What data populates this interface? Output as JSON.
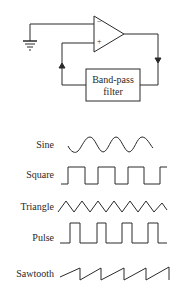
{
  "circuit": {
    "filter_label_line1": "Band-pass",
    "filter_label_line2": "filter",
    "inverting_sign": "−",
    "noninverting_sign": "+"
  },
  "waveforms": [
    {
      "label": "Sine"
    },
    {
      "label": "Square"
    },
    {
      "label": "Triangle"
    },
    {
      "label": "Pulse"
    },
    {
      "label": "Sawtooth"
    }
  ],
  "colors": {
    "stroke": "#2a2a2a",
    "background": "#ffffff"
  }
}
